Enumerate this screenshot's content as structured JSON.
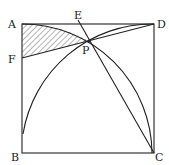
{
  "figure": {
    "type": "geometry",
    "labels": {
      "A": "A",
      "B": "B",
      "C": "C",
      "D": "D",
      "E": "E",
      "F": "F",
      "P": "P"
    },
    "shaded_region": "region bounded by AF, FP and arc AP",
    "colors": {
      "stroke": "#222222",
      "hatch": "#444444",
      "background": "#ffffff"
    }
  }
}
